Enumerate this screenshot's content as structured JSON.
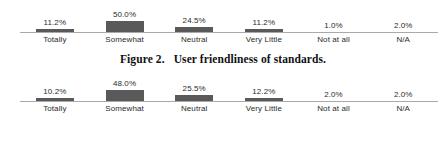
{
  "caption": {
    "number": "Figure 2.",
    "text": "User friendliness of standards."
  },
  "colors": {
    "bar": "#595959",
    "axis": "#a9a9a9",
    "text": "#2b2b2b",
    "caption": "#111111",
    "background": "#ffffff"
  },
  "chart_data": [
    {
      "type": "bar",
      "title": "",
      "xlabel": "",
      "ylabel": "",
      "ylim": [
        0,
        50
      ],
      "grid": false,
      "legend": "none",
      "categories": [
        "Totally",
        "Somewhat",
        "Neutral",
        "Very Little",
        "Not at all",
        "N/A"
      ],
      "values": [
        11.2,
        50.0,
        24.5,
        11.2,
        1.0,
        2.0
      ],
      "value_labels": [
        "11.2%",
        "50.0%",
        "24.5%",
        "11.2%",
        "1.0%",
        "2.0%"
      ]
    },
    {
      "type": "bar",
      "title": "",
      "xlabel": "",
      "ylabel": "",
      "ylim": [
        0,
        50
      ],
      "grid": false,
      "legend": "none",
      "categories": [
        "Totally",
        "Somewhat",
        "Neutral",
        "Very Little",
        "Not at all",
        "N/A"
      ],
      "values": [
        10.2,
        48.0,
        25.5,
        12.2,
        2.0,
        2.0
      ],
      "value_labels": [
        "10.2%",
        "48.0%",
        "25.5%",
        "12.2%",
        "2.0%",
        "2.0%"
      ]
    }
  ]
}
